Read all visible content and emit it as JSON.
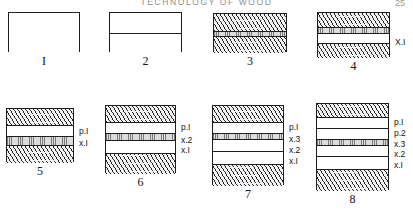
{
  "page": {
    "running_head": "TECHNOLOGY OF WOOD",
    "number": "25"
  },
  "figures": [
    {
      "id": "figure-1",
      "caption": "I",
      "x": 8,
      "y": 12,
      "width": 72,
      "height": 40,
      "bands": [
        {
          "type": "blank",
          "height": 40
        }
      ],
      "labels": []
    },
    {
      "id": "figure-2",
      "caption": "2",
      "x": 109,
      "y": 12,
      "width": 73,
      "height": 40,
      "bands": [
        {
          "type": "blank",
          "height": 20
        },
        {
          "type": "blank",
          "height": 20
        }
      ],
      "labels": []
    },
    {
      "id": "figure-3",
      "caption": "3",
      "x": 213,
      "y": 13,
      "width": 74,
      "height": 39,
      "bands": [
        {
          "type": "hatch",
          "height": 17
        },
        {
          "type": "stipple",
          "height": 5
        },
        {
          "type": "hatch",
          "height": 17
        }
      ],
      "labels": []
    },
    {
      "id": "figure-4",
      "caption": "4",
      "x": 317,
      "y": 12,
      "width": 73,
      "height": 45,
      "bands": [
        {
          "type": "hatch",
          "height": 14
        },
        {
          "type": "stipple",
          "height": 6
        },
        {
          "type": "blank",
          "height": 10,
          "label": "X.I"
        },
        {
          "type": "hatch",
          "height": 15
        }
      ],
      "labels": [
        {
          "text": "X.I",
          "top": 26
        }
      ]
    },
    {
      "id": "figure-5",
      "caption": "5",
      "x": 6,
      "y": 108,
      "width": 68,
      "height": 54,
      "bands": [
        {
          "type": "hatch",
          "height": 16
        },
        {
          "type": "blank",
          "height": 11,
          "label": "p.I"
        },
        {
          "type": "stipple",
          "height": 9,
          "label": "x.I"
        },
        {
          "type": "hatch",
          "height": 18
        }
      ],
      "labels": [
        {
          "text": "p.I",
          "top": 19
        },
        {
          "text": "x.I",
          "top": 31
        }
      ]
    },
    {
      "id": "figure-6",
      "caption": "6",
      "x": 105,
      "y": 105,
      "width": 71,
      "height": 68,
      "bands": [
        {
          "type": "hatch",
          "height": 16
        },
        {
          "type": "blank",
          "height": 11,
          "label": "p.I"
        },
        {
          "type": "stipple",
          "height": 7,
          "label": "x.2"
        },
        {
          "type": "blank",
          "height": 13,
          "label": "x.I"
        },
        {
          "type": "hatch",
          "height": 21
        }
      ],
      "labels": [
        {
          "text": "p.I",
          "top": 18
        },
        {
          "text": "x.2",
          "top": 31
        },
        {
          "text": "x.I",
          "top": 41
        }
      ]
    },
    {
      "id": "figure-7",
      "caption": "7",
      "x": 212,
      "y": 105,
      "width": 72,
      "height": 80,
      "bands": [
        {
          "type": "hatch",
          "height": 16
        },
        {
          "type": "blank",
          "height": 11,
          "label": "p.I"
        },
        {
          "type": "stipple",
          "height": 6,
          "label": "x.3"
        },
        {
          "type": "blank",
          "height": 12,
          "label": "x.2"
        },
        {
          "type": "blank",
          "height": 13,
          "label": "x.I"
        },
        {
          "type": "hatch",
          "height": 22
        }
      ],
      "labels": [
        {
          "text": "p.I",
          "top": 18
        },
        {
          "text": "x.3",
          "top": 30
        },
        {
          "text": "x.2",
          "top": 41
        },
        {
          "text": "x.I",
          "top": 52
        }
      ]
    },
    {
      "id": "figure-8",
      "caption": "8",
      "x": 316,
      "y": 103,
      "width": 73,
      "height": 87,
      "bands": [
        {
          "type": "hatch",
          "height": 13
        },
        {
          "type": "blank",
          "height": 11,
          "label": "p.I"
        },
        {
          "type": "blank",
          "height": 11,
          "label": "p.2"
        },
        {
          "type": "stipple",
          "height": 6,
          "label": "x.3"
        },
        {
          "type": "blank",
          "height": 11,
          "label": "x.2"
        },
        {
          "type": "blank",
          "height": 13,
          "label": "x.I"
        },
        {
          "type": "hatch",
          "height": 22
        }
      ],
      "labels": [
        {
          "text": "p.I",
          "top": 15
        },
        {
          "text": "p.2",
          "top": 26
        },
        {
          "text": "x.3",
          "top": 37
        },
        {
          "text": "x.2",
          "top": 47
        },
        {
          "text": "x.I",
          "top": 58
        }
      ]
    }
  ]
}
